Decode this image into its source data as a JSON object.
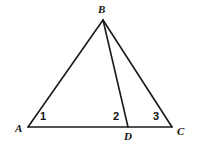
{
  "figure": {
    "background_color": "#ffffff",
    "stroke_color": "#1a1a1a",
    "stroke_width": 1.6,
    "width": 197,
    "height": 145,
    "points": {
      "A": {
        "x": 28,
        "y": 127
      },
      "B": {
        "x": 103,
        "y": 20
      },
      "C": {
        "x": 172,
        "y": 127
      },
      "D": {
        "x": 128,
        "y": 127
      }
    },
    "segments": [
      {
        "name": "AB",
        "from": "A",
        "to": "B"
      },
      {
        "name": "BC",
        "from": "B",
        "to": "C"
      },
      {
        "name": "AC",
        "from": "A",
        "to": "C"
      },
      {
        "name": "BD",
        "from": "B",
        "to": "D"
      }
    ],
    "vertex_labels": [
      {
        "id": "A",
        "text": "A",
        "x": 15,
        "y": 123
      },
      {
        "id": "B",
        "text": "B",
        "x": 98,
        "y": 4
      },
      {
        "id": "C",
        "text": "C",
        "x": 177,
        "y": 126
      },
      {
        "id": "D",
        "text": "D",
        "x": 124,
        "y": 131
      }
    ],
    "angle_labels": [
      {
        "id": "angle-1",
        "text": "1",
        "x": 40,
        "y": 111,
        "at_vertex": "A"
      },
      {
        "id": "angle-2",
        "text": "2",
        "x": 113,
        "y": 111,
        "at_vertex": "D"
      },
      {
        "id": "angle-3",
        "text": "3",
        "x": 153,
        "y": 111,
        "at_vertex": "C"
      }
    ]
  }
}
